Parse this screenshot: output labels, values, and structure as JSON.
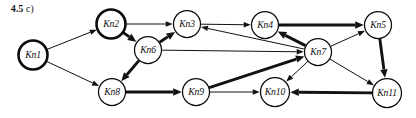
{
  "figure": {
    "caption_number": "4.5",
    "caption_suffix": "c)",
    "width": 416,
    "height": 118,
    "background_color": "#ffffff",
    "ink_color": "#121212"
  },
  "graph": {
    "type": "directed-graph",
    "node_radius_default": 13.5,
    "nodes": [
      {
        "id": "Kn1",
        "label": "Kn1",
        "x": 33,
        "y": 55,
        "r": 14.5,
        "emphasis": "bold"
      },
      {
        "id": "Kn2",
        "label": "Kn2",
        "x": 111,
        "y": 24,
        "r": 14.5,
        "emphasis": "bold"
      },
      {
        "id": "Kn3",
        "label": "Kn3",
        "x": 187,
        "y": 24,
        "r": 13.5,
        "emphasis": "normal"
      },
      {
        "id": "Kn4",
        "label": "Kn4",
        "x": 265,
        "y": 25,
        "r": 13.5,
        "emphasis": "normal"
      },
      {
        "id": "Kn5",
        "label": "Kn5",
        "x": 378,
        "y": 25,
        "r": 13.5,
        "emphasis": "normal"
      },
      {
        "id": "Kn6",
        "label": "Kn6",
        "x": 148,
        "y": 50,
        "r": 13.5,
        "emphasis": "normal"
      },
      {
        "id": "Kn7",
        "label": "Kn7",
        "x": 318,
        "y": 52,
        "r": 13.5,
        "emphasis": "normal"
      },
      {
        "id": "Kn8",
        "label": "Kn8",
        "x": 112,
        "y": 92,
        "r": 13.5,
        "emphasis": "normal"
      },
      {
        "id": "Kn9",
        "label": "Kn9",
        "x": 196,
        "y": 92,
        "r": 13.5,
        "emphasis": "normal"
      },
      {
        "id": "Kn10",
        "label": "Kn10",
        "x": 275,
        "y": 92,
        "r": 14.5,
        "emphasis": "normal"
      },
      {
        "id": "Kn11",
        "label": "Kn11",
        "x": 387,
        "y": 93,
        "r": 14.5,
        "emphasis": "normal"
      }
    ],
    "edges": [
      {
        "from": "Kn1",
        "to": "Kn2",
        "weight": "thin"
      },
      {
        "from": "Kn1",
        "to": "Kn8",
        "weight": "thin"
      },
      {
        "from": "Kn2",
        "to": "Kn3",
        "weight": "thin"
      },
      {
        "from": "Kn2",
        "to": "Kn6",
        "weight": "thick"
      },
      {
        "from": "Kn6",
        "to": "Kn3",
        "weight": "thick"
      },
      {
        "from": "Kn6",
        "to": "Kn8",
        "weight": "thick"
      },
      {
        "from": "Kn6",
        "to": "Kn7",
        "weight": "thin"
      },
      {
        "from": "Kn3",
        "to": "Kn4",
        "weight": "thin"
      },
      {
        "from": "Kn7",
        "to": "Kn3",
        "weight": "thin"
      },
      {
        "from": "Kn7",
        "to": "Kn4",
        "weight": "thick"
      },
      {
        "from": "Kn4",
        "to": "Kn5",
        "weight": "thick"
      },
      {
        "from": "Kn7",
        "to": "Kn5",
        "weight": "thin"
      },
      {
        "from": "Kn5",
        "to": "Kn11",
        "weight": "thick"
      },
      {
        "from": "Kn7",
        "to": "Kn11",
        "weight": "thin"
      },
      {
        "from": "Kn8",
        "to": "Kn9",
        "weight": "thick"
      },
      {
        "from": "Kn9",
        "to": "Kn10",
        "weight": "thin"
      },
      {
        "from": "Kn9",
        "to": "Kn7",
        "weight": "thick"
      },
      {
        "from": "Kn7",
        "to": "Kn10",
        "weight": "thin"
      },
      {
        "from": "Kn11",
        "to": "Kn10",
        "weight": "thick"
      }
    ]
  }
}
